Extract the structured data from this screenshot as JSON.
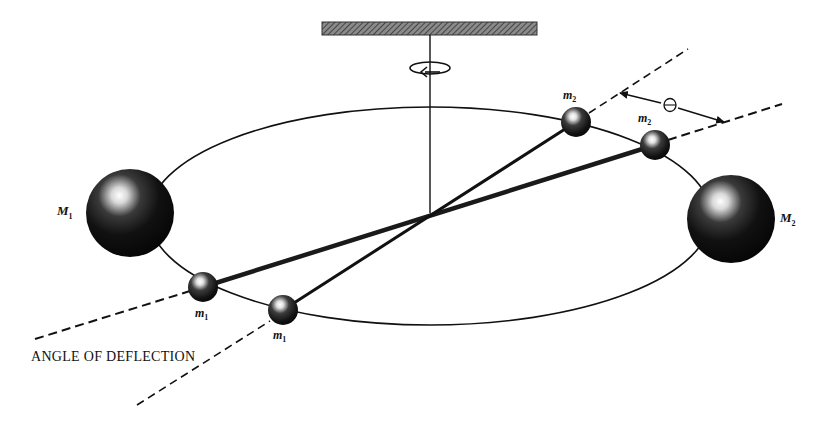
{
  "diagram": {
    "labels": {
      "M1": {
        "base": "M",
        "sub": "1"
      },
      "M2": {
        "base": "M",
        "sub": "2"
      },
      "m1_a": {
        "base": "m",
        "sub": "1"
      },
      "m1_b": {
        "base": "m",
        "sub": "1"
      },
      "m2_a": {
        "base": "m",
        "sub": "2"
      },
      "m2_b": {
        "base": "m",
        "sub": "2"
      },
      "theta": "Θ",
      "caption": "ANGLE OF DEFLECTION"
    },
    "colors": {
      "ink": "#111111",
      "background": "#ffffff",
      "support_fill": "#6a6a6a"
    }
  }
}
